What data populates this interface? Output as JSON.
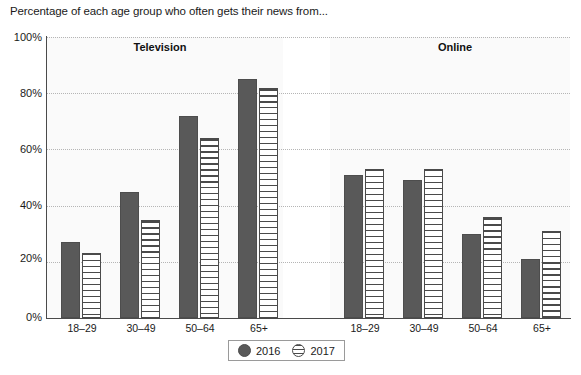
{
  "chart_data": {
    "type": "bar",
    "title": "Percentage of each age group who often gets their news from...",
    "xlabel": "",
    "ylabel": "",
    "ylim": [
      0,
      100
    ],
    "ytick_labels": [
      "0%",
      "20%",
      "40%",
      "60%",
      "80%",
      "100%"
    ],
    "ytick_values": [
      0,
      20,
      40,
      60,
      80,
      100
    ],
    "grid": true,
    "legend_position": "bottom-center",
    "legend_entries": [
      "2016",
      "2017"
    ],
    "categories": [
      "18–29",
      "30–49",
      "50–64",
      "65+"
    ],
    "panels": [
      {
        "name": "Television",
        "categories": [
          "18–29",
          "30–49",
          "50–64",
          "65+"
        ],
        "series": [
          {
            "name": "2016",
            "values": [
              27,
              45,
              72,
              85
            ]
          },
          {
            "name": "2017",
            "values": [
              23,
              35,
              64,
              82
            ]
          }
        ]
      },
      {
        "name": "Online",
        "categories": [
          "18–29",
          "30–49",
          "50–64",
          "65+"
        ],
        "series": [
          {
            "name": "2016",
            "values": [
              51,
              49,
              30,
              21
            ]
          },
          {
            "name": "2017",
            "values": [
              53,
              53,
              36,
              31
            ]
          }
        ]
      }
    ],
    "colors": {
      "series_2016": "#595959",
      "series_2017_fill": "#ffffff",
      "series_2017_stripe": "#4a4a4a",
      "gridline": "#b5b5b5",
      "axis": "#4a4a4a",
      "panel_background": "#fafafa",
      "text": "#1a1a1a"
    }
  }
}
